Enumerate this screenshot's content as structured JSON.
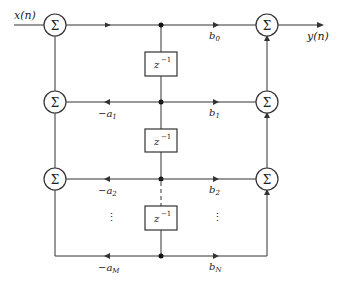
{
  "diagram": {
    "input_label": "x(n)",
    "output_label": "y(n)",
    "sum_symbol": "Σ",
    "delay_label": "z",
    "delay_exp": "−1",
    "feedback": [
      {
        "label": "−a",
        "sub": "1"
      },
      {
        "label": "−a",
        "sub": "2"
      },
      {
        "label": "−a",
        "sub": "M"
      }
    ],
    "feedforward": [
      {
        "label": "b",
        "sub": "0"
      },
      {
        "label": "b",
        "sub": "1"
      },
      {
        "label": "b",
        "sub": "2"
      },
      {
        "label": "b",
        "sub": "N"
      }
    ],
    "ellipsis": "⋮",
    "colors": {
      "line": "#333333",
      "bg": "#ffffff"
    }
  }
}
